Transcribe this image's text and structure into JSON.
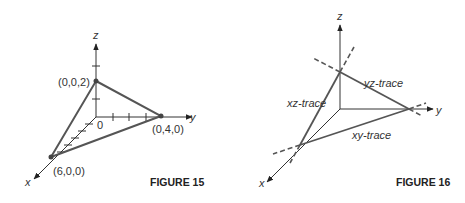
{
  "figures": [
    {
      "caption": "FIGURE 15",
      "axes": {
        "x": "x",
        "y": "y",
        "z": "z",
        "origin": "0"
      },
      "points": [
        {
          "label": "(0,0,2)"
        },
        {
          "label": "(0,4,0)"
        },
        {
          "label": "(6,0,0)"
        }
      ]
    },
    {
      "caption": "FIGURE 16",
      "axes": {
        "x": "x",
        "y": "y",
        "z": "z"
      },
      "traces": [
        {
          "label": "xz-trace"
        },
        {
          "label": "yz-trace"
        },
        {
          "label": "xy-trace"
        }
      ]
    }
  ],
  "colors": {
    "line": "#555555",
    "axis": "#333333",
    "text": "#333333"
  }
}
